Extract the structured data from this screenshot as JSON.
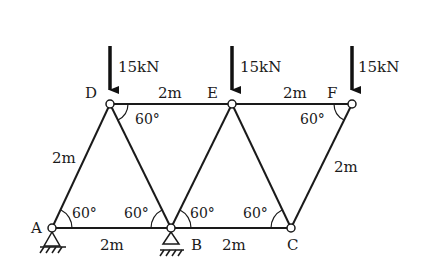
{
  "diagram": {
    "type": "truss",
    "nodes": [
      {
        "id": "A",
        "label": "A",
        "x": 52,
        "y": 228,
        "support": "pin"
      },
      {
        "id": "B",
        "label": "B",
        "x": 171,
        "y": 228,
        "support": "roller"
      },
      {
        "id": "C",
        "label": "C",
        "x": 291,
        "y": 228
      },
      {
        "id": "D",
        "label": "D",
        "x": 110,
        "y": 104
      },
      {
        "id": "E",
        "label": "E",
        "x": 232,
        "y": 104
      },
      {
        "id": "F",
        "label": "F",
        "x": 352,
        "y": 104
      }
    ],
    "members": [
      [
        "A",
        "B"
      ],
      [
        "B",
        "C"
      ],
      [
        "D",
        "E"
      ],
      [
        "E",
        "F"
      ],
      [
        "A",
        "D"
      ],
      [
        "D",
        "B"
      ],
      [
        "B",
        "E"
      ],
      [
        "E",
        "C"
      ],
      [
        "C",
        "F"
      ]
    ],
    "loads": [
      {
        "node": "D",
        "label": "15kN"
      },
      {
        "node": "E",
        "label": "15kN"
      },
      {
        "node": "F",
        "label": "15kN"
      }
    ],
    "lengths": {
      "DE": "2m",
      "EF": "2m",
      "AD": "2m",
      "AB": "2m",
      "BC": "2m",
      "CF": "2m"
    },
    "angles": {
      "D": "60°",
      "F": "60°",
      "A": "60°",
      "B_left": "60°",
      "B_right": "60°",
      "C": "60°"
    }
  }
}
